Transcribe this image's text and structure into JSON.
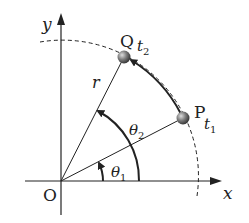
{
  "diagram": {
    "axes": {
      "x_label": "x",
      "y_label": "y",
      "origin_label": "O"
    },
    "points": [
      {
        "id": "P",
        "label": "P",
        "time_label": "t",
        "time_sub": "1"
      },
      {
        "id": "Q",
        "label": "Q",
        "time_label": "t",
        "time_sub": "2"
      }
    ],
    "radius_label": "r",
    "angles": [
      {
        "symbol": "θ",
        "sub": "1"
      },
      {
        "symbol": "θ",
        "sub": "2"
      }
    ],
    "colors": {
      "line": "#222222",
      "ball": "#6b6b6b"
    }
  }
}
